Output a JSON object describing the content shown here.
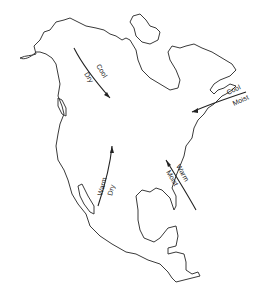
{
  "map": {
    "subject": "North America air masses",
    "air_masses": [
      {
        "id": "cool-dry",
        "line1": "Cool",
        "line2": "Dry"
      },
      {
        "id": "cool-moist",
        "line1": "Cool",
        "line2": "Moist"
      },
      {
        "id": "warm-dry",
        "line1": "Warm",
        "line2": "Dry"
      },
      {
        "id": "warm-moist",
        "line1": "Warm",
        "line2": "Moist"
      }
    ]
  }
}
